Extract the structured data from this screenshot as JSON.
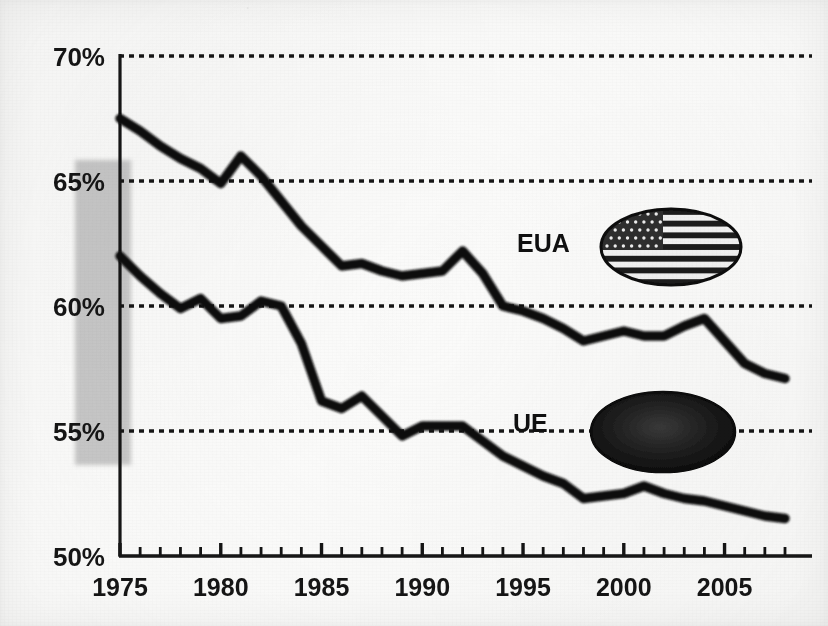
{
  "figure": {
    "kind": "scanned-line-chart",
    "ghost_text": {
      "line1": "    .          ",
      "line2": "  ",
      "line3": "  ",
      "line4": "  ",
      "line5": "  ",
      "line6": "  ",
      "line7": "  "
    }
  },
  "colors": {
    "ink": "#101010",
    "paper": "#fbfbfa",
    "gridline": "#1a1a1a",
    "highlight_band": "#c2c2c2",
    "eua_line": "#121212",
    "ue_line": "#121212",
    "ue_flag_fill": "#171717"
  },
  "axes": {
    "y_ticks": [
      "50%",
      "55%",
      "60%",
      "65%",
      "70%"
    ],
    "x_ticks": [
      "1975",
      "1980",
      "1985",
      "1990",
      "1995",
      "2000",
      "2005"
    ]
  },
  "legend": {
    "eua_label": "EUA",
    "ue_label": "UE",
    "eua_icon": "us-flag-ellipse",
    "ue_icon": "eu-flag-ellipse"
  },
  "annotations": {
    "highlight_band_label": "shaded-range-1975"
  },
  "chart_data": {
    "type": "line",
    "title": "",
    "subtitle": "",
    "xlabel": "",
    "ylabel": "",
    "xlim": [
      1975,
      2008
    ],
    "ylim": [
      50,
      70
    ],
    "yticks": [
      50,
      55,
      60,
      65,
      70
    ],
    "ytick_labels": [
      "50%",
      "55%",
      "60%",
      "65%",
      "70%"
    ],
    "xticks": [
      1975,
      1980,
      1985,
      1990,
      1995,
      2000,
      2005
    ],
    "xtick_labels": [
      "1975",
      "1980",
      "1985",
      "1990",
      "1995",
      "2000",
      "2005"
    ],
    "minor_xtick_interval": 1,
    "grid": "horizontal-dashed",
    "legend_position": "inline-right",
    "units": "percent",
    "x": [
      1975,
      1976,
      1977,
      1978,
      1979,
      1980,
      1981,
      1982,
      1983,
      1984,
      1985,
      1986,
      1987,
      1988,
      1989,
      1990,
      1991,
      1992,
      1993,
      1994,
      1995,
      1996,
      1997,
      1998,
      1999,
      2000,
      2001,
      2002,
      2003,
      2004,
      2005,
      2006,
      2007,
      2008
    ],
    "series": [
      {
        "name": "EUA",
        "values": [
          67.5,
          67.0,
          66.4,
          65.9,
          65.5,
          64.9,
          66.0,
          65.2,
          64.2,
          63.2,
          62.4,
          61.6,
          61.7,
          61.4,
          61.2,
          61.3,
          61.4,
          62.2,
          61.3,
          60.0,
          59.8,
          59.5,
          59.1,
          58.6,
          58.8,
          59.0,
          58.8,
          58.8,
          59.2,
          59.5,
          58.6,
          57.7,
          57.3,
          57.1
        ]
      },
      {
        "name": "UE",
        "values": [
          62.0,
          61.2,
          60.5,
          59.9,
          60.3,
          59.5,
          59.6,
          60.2,
          60.0,
          58.5,
          56.2,
          55.9,
          56.4,
          55.6,
          54.8,
          55.2,
          55.2,
          55.2,
          54.6,
          54.0,
          53.6,
          53.2,
          52.9,
          52.3,
          52.4,
          52.5,
          52.8,
          52.5,
          52.3,
          52.2,
          52.0,
          51.8,
          51.6,
          51.5
        ]
      }
    ],
    "highlight_band": {
      "orientation": "vertical-rect",
      "x_range": [
        1974.2,
        1975.0
      ],
      "y_range": [
        55.0,
        65.6
      ],
      "color": "#c2c2c2"
    }
  }
}
